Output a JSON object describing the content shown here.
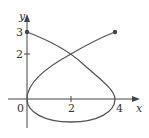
{
  "figure": {
    "type": "parametric-curve-plot",
    "axes": {
      "x_label": "x",
      "y_label": "y",
      "origin_label": "0",
      "x_ticks": [
        {
          "value": 2,
          "label": "2"
        },
        {
          "value": 4,
          "label": "4"
        }
      ],
      "y_ticks": [
        {
          "value": 2,
          "label": "2"
        },
        {
          "value": 3,
          "label": "3"
        }
      ]
    },
    "endpoints": [
      {
        "x": 0,
        "y": 3
      },
      {
        "x": 4,
        "y": 3
      }
    ],
    "key_points": [
      {
        "x": 0,
        "y": 3,
        "note": "start endpoint"
      },
      {
        "x": 2,
        "y": 2,
        "note": "self-intersection"
      },
      {
        "x": 4,
        "y": 0,
        "note": "rightmost point"
      },
      {
        "x": 2,
        "y": -1,
        "note": "lowest point"
      },
      {
        "x": 0,
        "y": 0,
        "note": "leftmost point at origin"
      },
      {
        "x": 4,
        "y": 3,
        "note": "end endpoint"
      }
    ],
    "colors": {
      "curve": "#555555",
      "axes": "#444444",
      "labels": "#333333"
    }
  }
}
